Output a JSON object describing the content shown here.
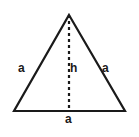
{
  "figure": {
    "type": "geometry-diagram",
    "shape": "equilateral-triangle",
    "background_color": "#ffffff",
    "stroke_color": "#1a1a1a",
    "stroke_width": 2,
    "labels": {
      "side_left": "a",
      "side_right": "a",
      "height": "h",
      "base": "a"
    },
    "geometry": {
      "apex": {
        "x": 69,
        "y": 15
      },
      "bottom_left": {
        "x": 14,
        "y": 111
      },
      "bottom_right": {
        "x": 125,
        "y": 111
      },
      "height_line": {
        "from": {
          "x": 69,
          "y": 15
        },
        "to": {
          "x": 69,
          "y": 111
        },
        "style": "dashed",
        "dash_pattern": "3 3"
      }
    }
  }
}
